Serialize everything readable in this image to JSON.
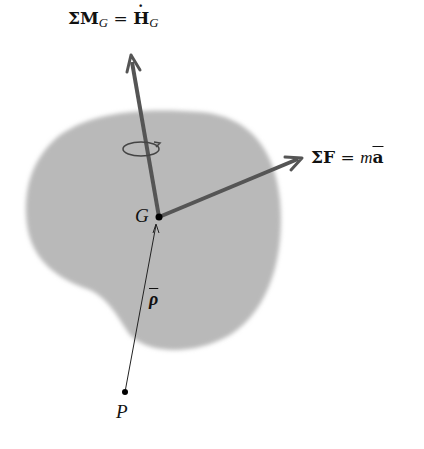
{
  "diagram": {
    "moment_label": {
      "sigma": "Σ",
      "symbol": "M",
      "sub": "G",
      "eq": " = ",
      "rhs": "H",
      "rhs_sub": "G",
      "rhs_accent": "dot"
    },
    "force_label": {
      "sigma": "Σ",
      "symbol": "F",
      "eq": " = ",
      "m": "m",
      "a": "a",
      "a_accent": "bar"
    },
    "center_label": "G",
    "point_label": "P",
    "position_label": "ρ",
    "colors": {
      "body": "#b8b8b8",
      "arrow": "#555555",
      "text": "#111111"
    }
  }
}
